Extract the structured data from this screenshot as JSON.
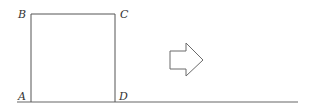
{
  "diagram": {
    "type": "geometry-figure",
    "colors": {
      "stroke": "#555555",
      "baseline": "#666666",
      "arrow_stroke": "#6a6a6a",
      "label": "#333333",
      "background": "#ffffff"
    },
    "square": {
      "vertices": [
        {
          "name": "A",
          "position": "bottom-left"
        },
        {
          "name": "B",
          "position": "top-left"
        },
        {
          "name": "C",
          "position": "top-right"
        },
        {
          "name": "D",
          "position": "bottom-right"
        }
      ]
    },
    "labels": {
      "A": "A",
      "B": "B",
      "C": "C",
      "D": "D"
    },
    "arrow": {
      "direction": "right",
      "style": "outlined-block-arrow",
      "icon": "arrow-right-outline-icon"
    },
    "baseline": {
      "orientation": "horizontal",
      "passes_through": [
        "A",
        "D"
      ]
    }
  }
}
